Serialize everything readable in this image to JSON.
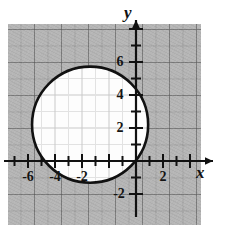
{
  "figure": {
    "background_color": "#ffffff",
    "grid_color": "#b9b9b9",
    "interior_color": "#fdfdfd",
    "curve_color": "#111111"
  },
  "axes": {
    "x_axis_label": "x",
    "y_axis_label": "y",
    "x_ticks": [
      {
        "value": -6,
        "label": "-6"
      },
      {
        "value": -4,
        "label": "-4"
      },
      {
        "value": -2,
        "label": "-2"
      },
      {
        "value": 2,
        "label": "2"
      }
    ],
    "y_ticks": [
      {
        "value": 6,
        "label": "6"
      },
      {
        "value": 4,
        "label": "4"
      },
      {
        "value": 2,
        "label": "2"
      },
      {
        "value": -2,
        "label": "-2"
      }
    ]
  },
  "chart_data": {
    "type": "scatter",
    "title": "",
    "xlabel": "x",
    "ylabel": "y",
    "xlim": [
      -9.5,
      4.7
    ],
    "ylim": [
      -3.2,
      9.0
    ],
    "grid": true,
    "legend": "none",
    "x_ticks": [
      -6,
      -4,
      -2,
      2
    ],
    "x_tick_labels": [
      "-6",
      "-4",
      "-2",
      "2"
    ],
    "y_ticks": [
      6,
      4,
      2,
      -2
    ],
    "y_tick_labels": [
      "6",
      "4",
      "2",
      "-2"
    ],
    "x_minor_tick_step": 1,
    "y_minor_tick_step": 1,
    "series": [
      {
        "name": "circle",
        "shape": "circle",
        "center_x": -3.4,
        "center_y": 2.2,
        "radius": 4.3,
        "filled": true,
        "fill": "#fdfdfd",
        "stroke": "#111111",
        "stroke_width": 2.6
      }
    ],
    "annotations": []
  }
}
